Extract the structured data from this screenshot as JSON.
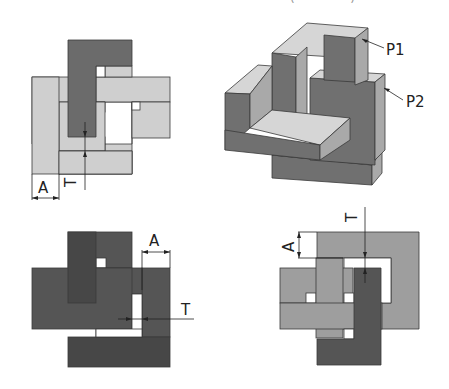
{
  "figure": {
    "top_captions": [
      "— —————— —",
      "( ———— )"
    ],
    "labels": {
      "dimension_A": "A",
      "dimension_T": "T",
      "point_1": "P1",
      "point_2": "P2"
    },
    "colors": {
      "light": "#cfcfcf",
      "mid": "#9e9e9e",
      "dark": "#6b6b6b",
      "darker": "#555555",
      "darkest": "#474747",
      "top_face": "#d6d6d6",
      "side_face": "#a9a9a9",
      "front_face": "#707070",
      "edge": "#3a3a3a"
    },
    "views": [
      {
        "name": "front-view",
        "position": "top-left"
      },
      {
        "name": "isometric-view",
        "position": "top-right"
      },
      {
        "name": "top-view",
        "position": "bottom-left"
      },
      {
        "name": "side-view",
        "position": "bottom-right"
      }
    ]
  }
}
